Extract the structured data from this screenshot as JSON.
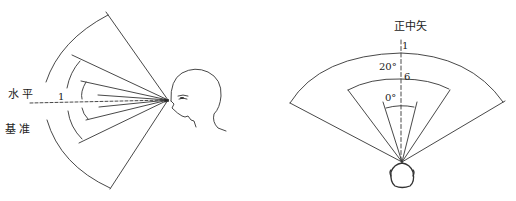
{
  "colors": {
    "line": "#333333",
    "text": "#222222",
    "background": "#ffffff"
  },
  "side_view": {
    "horizontal_label": "水 平",
    "reference_label": "基 准",
    "line_number": "1"
  },
  "top_view": {
    "midsagittal_label": "正中矢",
    "outer_line_number": "1",
    "middle_line_number": "6",
    "outer_angle_label": "20°",
    "inner_angle_label": "0°"
  }
}
